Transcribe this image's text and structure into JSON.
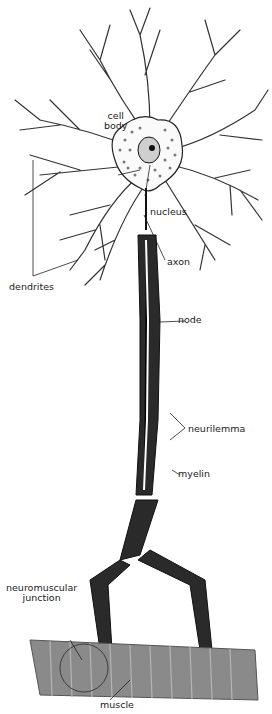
{
  "diagram": {
    "labels": {
      "cell_body_1": "cell",
      "cell_body_2": "body",
      "nucleus": "nucleus",
      "dendrites": "dendrites",
      "axon": "axon",
      "node": "node",
      "neurilemma": "neurilemma",
      "myelin": "myelin",
      "nmj_1": "neuromuscular",
      "nmj_2": "junction",
      "muscle": "muscle"
    },
    "colors": {
      "ink": "#1a1a1a",
      "myelin_dark": "#2a2a2a",
      "cell_dots": "#7a7a7a",
      "muscle": "#8a8a8a",
      "muscle_dark": "#6a6a6a",
      "background": "#ffffff"
    }
  }
}
